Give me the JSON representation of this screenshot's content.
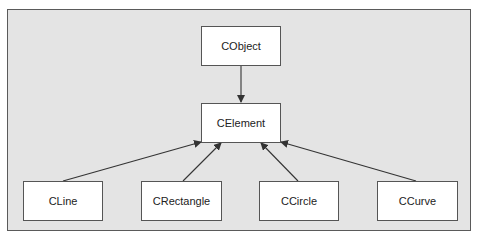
{
  "diagram": {
    "type": "class-hierarchy",
    "nodes": [
      {
        "id": "cobject",
        "label": "CObject"
      },
      {
        "id": "celement",
        "label": "CElement"
      },
      {
        "id": "cline",
        "label": "CLine"
      },
      {
        "id": "crectangle",
        "label": "CRectangle"
      },
      {
        "id": "ccircle",
        "label": "CCircle"
      },
      {
        "id": "ccurve",
        "label": "CCurve"
      }
    ],
    "edges": [
      {
        "from": "cobject",
        "to": "celement"
      },
      {
        "from": "cline",
        "to": "celement"
      },
      {
        "from": "crectangle",
        "to": "celement"
      },
      {
        "from": "ccircle",
        "to": "celement"
      },
      {
        "from": "ccurve",
        "to": "celement"
      }
    ],
    "colors": {
      "background": "#e4e4e4",
      "box": "#ffffff",
      "border": "#555555",
      "line": "#333333"
    }
  }
}
